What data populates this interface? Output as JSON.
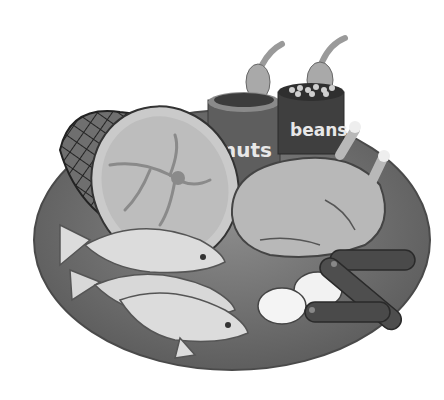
{
  "illustration": {
    "subject": "food-plate-clipart",
    "colors": {
      "background": "#ffffff",
      "plate": "#6e6e6e",
      "plate_rim": "#555555",
      "can_nuts": "#5a5a5a",
      "can_beans": "#3e3e3e",
      "ham_face": "#c9c9c9",
      "ham_skin": "#6a6a6a",
      "chicken": "#b5b5b5",
      "fish": "#dcdcdc",
      "sausage": "#4a4a4a",
      "egg": "#f2f2f2"
    },
    "items": {
      "nuts_can": {
        "label": "nuts"
      },
      "beans_can": {
        "label": "beans"
      },
      "ham": {
        "label": ""
      },
      "chicken": {
        "label": ""
      },
      "fish": {
        "count": "3"
      },
      "eggs": {
        "count": "2"
      },
      "sausages": {
        "count": "3"
      }
    }
  }
}
